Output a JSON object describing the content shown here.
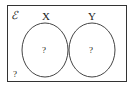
{
  "diagram": {
    "type": "venn",
    "universal_set": {
      "symbol": "ℰ",
      "outside_value": "?"
    },
    "sets": [
      {
        "name": "X",
        "value": "?"
      },
      {
        "name": "Y",
        "value": "?"
      }
    ],
    "relationship": "disjoint",
    "colors": {
      "stroke": "#333333",
      "background": "#ffffff"
    }
  }
}
